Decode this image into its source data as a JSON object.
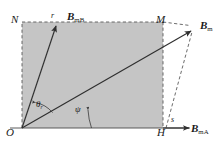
{
  "figure": {
    "type": "vector-diagram",
    "background_color": "#ffffff",
    "shaded_region_color": "#c4c4c4",
    "stroke_color": "#3a3a3a",
    "dashed_stroke_color": "#555555",
    "points": {
      "origin": {
        "label": "O",
        "x": 22,
        "y": 128
      },
      "top_left": {
        "label": "N",
        "x": 22,
        "y": 22
      },
      "top_right": {
        "label": "M",
        "x": 163,
        "y": 22
      },
      "bottom_right": {
        "label": "H",
        "x": 163,
        "y": 128
      },
      "resultant_tip": {
        "x": 193,
        "y": 30
      }
    },
    "vectors": [
      {
        "name": "vector-bmb",
        "label": "B",
        "subscript": "mB",
        "tip_marker_label": "r",
        "from": {
          "x": 22,
          "y": 128
        },
        "to": {
          "x": 57,
          "y": 25
        }
      },
      {
        "name": "vector-bm",
        "label": "B",
        "subscript": "m",
        "from": {
          "x": 22,
          "y": 128
        },
        "to": {
          "x": 193,
          "y": 30
        }
      },
      {
        "name": "vector-bma",
        "label": "B",
        "subscript": "mA",
        "tip_marker_label": "s",
        "from": {
          "x": 163,
          "y": 128
        },
        "to": {
          "x": 190,
          "y": 128
        }
      }
    ],
    "angles": [
      {
        "name": "angle-theta-r",
        "symbol": "θ",
        "subscript": "r"
      },
      {
        "name": "angle-psi",
        "symbol": "ψ",
        "subscript": ""
      }
    ]
  }
}
